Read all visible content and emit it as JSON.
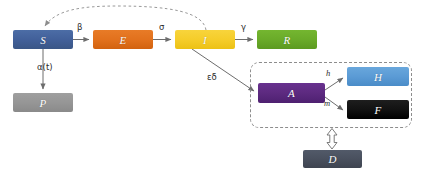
{
  "diagram": {
    "type": "flow-diagram",
    "canvas": {
      "width": 422,
      "height": 170,
      "background": "#ffffff"
    },
    "nodes": [
      {
        "id": "S",
        "label": "S",
        "name": "susceptible",
        "color": "#45659c",
        "color_dark": "#3a5686",
        "x": 13,
        "y": 30,
        "w": 60,
        "h": 19
      },
      {
        "id": "E",
        "label": "E",
        "name": "exposed",
        "color": "#e2711d",
        "color_dark": "#d2620f",
        "x": 93,
        "y": 30,
        "w": 60,
        "h": 19
      },
      {
        "id": "I",
        "label": "I",
        "name": "infectious",
        "color": "#f5cd2a",
        "color_dark": "#e8bf12",
        "x": 175,
        "y": 30,
        "w": 60,
        "h": 19
      },
      {
        "id": "R",
        "label": "R",
        "name": "recovered",
        "color": "#6aab29",
        "color_dark": "#5c9a20",
        "x": 257,
        "y": 30,
        "w": 60,
        "h": 19
      },
      {
        "id": "P",
        "label": "P",
        "name": "protected",
        "color": "#969696",
        "color_dark": "#888888",
        "x": 13,
        "y": 93,
        "w": 60,
        "h": 19
      },
      {
        "id": "A",
        "label": "A",
        "name": "ailing-quarantined",
        "color": "#5d2a80",
        "color_dark": "#4e2070",
        "x": 258,
        "y": 83,
        "w": 67,
        "h": 20
      },
      {
        "id": "H",
        "label": "H",
        "name": "healed-hospitalised",
        "color": "#5b9bd5",
        "color_dark": "#4a8cc8",
        "x": 347,
        "y": 67,
        "w": 62,
        "h": 19
      },
      {
        "id": "F",
        "label": "F",
        "name": "fatal",
        "color": "#141414",
        "color_dark": "#000000",
        "x": 347,
        "y": 100,
        "w": 62,
        "h": 19
      },
      {
        "id": "D",
        "label": "D",
        "name": "detected",
        "color": "#49505e",
        "color_dark": "#3e4450",
        "x": 303,
        "y": 150,
        "w": 59,
        "h": 18
      }
    ],
    "edge_labels": [
      {
        "id": "beta",
        "text": "β",
        "x": 77,
        "y": 24,
        "style": "greek"
      },
      {
        "id": "sigma",
        "text": "σ",
        "x": 159,
        "y": 24,
        "style": "greek"
      },
      {
        "id": "gamma",
        "text": "γ",
        "x": 241,
        "y": 24,
        "style": "greek"
      },
      {
        "id": "alpha_t",
        "text": "α(t)",
        "x": 38,
        "y": 64,
        "style": "greek"
      },
      {
        "id": "epsdelta",
        "text": "εδ",
        "x": 208,
        "y": 73,
        "style": "greek"
      },
      {
        "id": "h",
        "text": "h",
        "x": 326,
        "y": 70,
        "style": "italic"
      },
      {
        "id": "m",
        "text": "m",
        "x": 324,
        "y": 100,
        "style": "italic"
      }
    ],
    "group_box": {
      "name": "detected-group",
      "x": 250,
      "y": 62,
      "w": 162,
      "h": 66,
      "stroke": "#8d8d8d",
      "dashed": true
    },
    "arrow_color": "#6d6d6d",
    "dashed_feedback_color": "#8d8d8d"
  }
}
